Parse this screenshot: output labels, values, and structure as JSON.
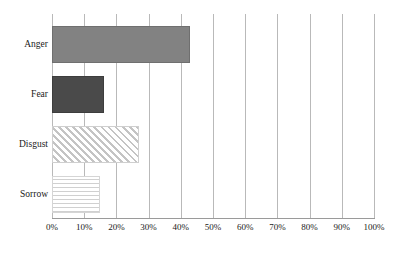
{
  "chart_data": {
    "type": "bar",
    "orientation": "horizontal",
    "title": "",
    "subtitle": "",
    "xlabel": "",
    "ylabel": "",
    "categories": [
      "Anger",
      "Fear",
      "Disgust",
      "Sorrow"
    ],
    "values": [
      43,
      16,
      27,
      15
    ],
    "value_suffix": "%",
    "xlim": [
      0,
      100
    ],
    "x_ticks": [
      0,
      10,
      20,
      30,
      40,
      50,
      60,
      70,
      80,
      90,
      100
    ],
    "x_tick_labels": [
      "0%",
      "10%",
      "20%",
      "30%",
      "40%",
      "50%",
      "60%",
      "70%",
      "80%",
      "90%",
      "100%"
    ],
    "grid": {
      "vertical": true,
      "horizontal": false
    },
    "legend": {
      "visible": false,
      "position": "none"
    },
    "annotations": [],
    "series": [
      {
        "name": "share",
        "values": [
          43,
          16,
          27,
          15
        ],
        "bars": [
          {
            "category": "Anger",
            "value": 43,
            "fill_style": "solid-mid",
            "color": "#828282"
          },
          {
            "category": "Fear",
            "value": 16,
            "fill_style": "solid-dark",
            "color": "#4a4a4a"
          },
          {
            "category": "Disgust",
            "value": 27,
            "fill_style": "diagonal",
            "color": "#c4c4c4"
          },
          {
            "category": "Sorrow",
            "value": 15,
            "fill_style": "stipple",
            "color": "#d0d0d0"
          }
        ]
      }
    ],
    "colors": {
      "gridline": "#b9b9b9",
      "axis": "#9a9a9a",
      "text": "#1a1a1a",
      "background": "#ffffff"
    }
  }
}
